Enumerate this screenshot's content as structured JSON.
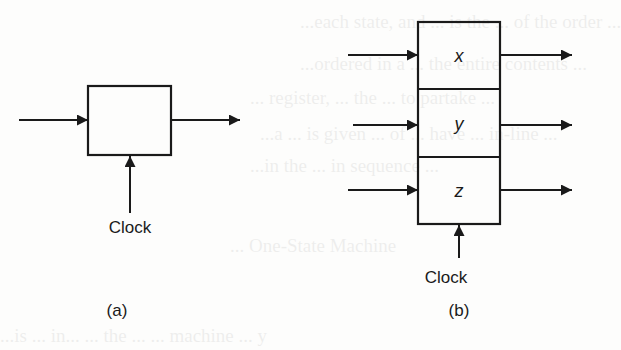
{
  "figure": {
    "panel_a": {
      "caption": "(a)",
      "clock_label": "Clock",
      "register_box": {
        "label": ""
      }
    },
    "panel_b": {
      "caption": "(b)",
      "clock_label": "Clock",
      "register_cells": [
        {
          "label": "x"
        },
        {
          "label": "y"
        },
        {
          "label": "z"
        }
      ]
    },
    "colors": {
      "stroke": "#1a1a1a",
      "background": "#fdfdfc"
    }
  },
  "background_bleed_text": {
    "lines": [
      "...each state, and ... is the ... of the order ...",
      "...ordered in a ... the entire contents ...",
      "... register, ... the ... to partake ... ",
      "...a ... is given ... of ... have ... in-line ...",
      "...in the ... in sequence ...",
      "... One-State Machine",
      "...is ... in... ... the ... ... machine ... y"
    ]
  }
}
